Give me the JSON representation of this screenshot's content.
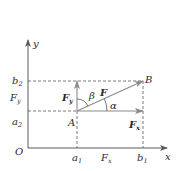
{
  "diagram": {
    "type": "vector-decomposition",
    "colors": {
      "axis": "#5a5a5a",
      "vector": "#8a8a8a",
      "dashed": "#555555",
      "text": "#2a2a2a"
    },
    "axes": {
      "x_label": "x",
      "y_label": "y",
      "origin_label": "O"
    },
    "points": {
      "A": "A",
      "B": "B"
    },
    "x_ticks": [
      {
        "main": "a",
        "sub": "1"
      },
      {
        "main": "b",
        "sub": "1"
      }
    ],
    "y_ticks": [
      {
        "main": "b",
        "sub": "2"
      },
      {
        "main": "a",
        "sub": "2"
      }
    ],
    "vectors": {
      "F": "F",
      "Fx": {
        "main": "F",
        "sub": "x"
      },
      "Fy": {
        "main": "F",
        "sub": "y"
      }
    },
    "projections": {
      "x": {
        "main": "F",
        "sub": "x"
      },
      "y": {
        "main": "F",
        "sub": "y"
      }
    },
    "angles": {
      "alpha": "α",
      "beta": "β"
    }
  }
}
